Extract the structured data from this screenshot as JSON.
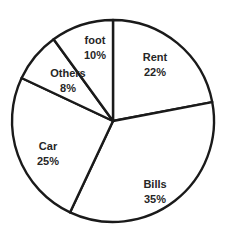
{
  "chart_data": {
    "type": "pie",
    "title": "",
    "labels": [
      "Rent",
      "Bills",
      "Car",
      "Others",
      "foot"
    ],
    "values": [
      22,
      35,
      25,
      8,
      10
    ],
    "value_suffix": "%",
    "categories": [
      "Rent",
      "Bills",
      "Car",
      "Others",
      "foot"
    ],
    "slices": [
      {
        "label": "Rent",
        "value": 22,
        "value_text": "22%",
        "label_x": 155,
        "label_y": 58,
        "color": "#ffffff"
      },
      {
        "label": "Bills",
        "value": 35,
        "value_text": "35%",
        "label_x": 155,
        "label_y": 185,
        "color": "#ffffff"
      },
      {
        "label": "Car",
        "value": 25,
        "value_text": "25%",
        "label_x": 48,
        "label_y": 147,
        "color": "#ffffff"
      },
      {
        "label": "Others",
        "value": 8,
        "value_text": "8%",
        "label_x": 68,
        "label_y": 74,
        "color": "#ffffff"
      },
      {
        "label": "foot",
        "value": 10,
        "value_text": "10%",
        "label_x": 95,
        "label_y": 41,
        "color": "#ffffff"
      }
    ],
    "total": 100,
    "start_angle_deg": 0,
    "direction": "clockwise",
    "legend": "none",
    "grid": false,
    "stroke_color": "#1a1a1a",
    "background_color": "#ffffff",
    "geometry": {
      "center_x": 113,
      "center_y": 121,
      "radius": 101,
      "stroke_width": 2.4
    }
  }
}
